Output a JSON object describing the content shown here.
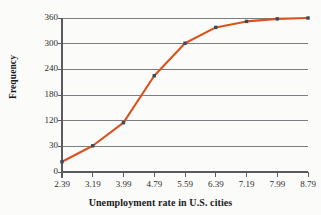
{
  "chart_data": {
    "type": "line",
    "title": "",
    "subtitle": "",
    "xlabel": "Unemployment rate in U.S. cities",
    "ylabel": "Frequency",
    "x": [
      2.39,
      3.19,
      3.99,
      4.79,
      5.59,
      6.39,
      7.19,
      7.99,
      8.79
    ],
    "xtick_labels": [
      "2.39",
      "3.19",
      "3.99",
      "4.79",
      "5.59",
      "6.39",
      "7.19",
      "7.99",
      "8.79"
    ],
    "values": [
      12,
      32,
      113,
      225,
      301,
      338,
      352,
      358,
      361
    ],
    "ytick_labels": [
      "0",
      "30",
      "120",
      "180",
      "240",
      "300",
      "360"
    ],
    "ytick_values": [
      0,
      30,
      120,
      180,
      240,
      300,
      360
    ],
    "ylim": [
      0,
      360
    ],
    "xlim": [
      2.39,
      8.79
    ],
    "grid": "horizontal",
    "legend": "none",
    "series": [
      {
        "name": "Cumulative frequency",
        "values": [
          12,
          32,
          113,
          225,
          301,
          338,
          352,
          358,
          361
        ]
      }
    ],
    "annotations": [],
    "colors": {
      "line": "#d9531e",
      "marker": "#3a4a5a",
      "gridline": "#6e6e73",
      "axis": "#5a5a5f",
      "background": "#fbfbfa",
      "text": "#1a1a1a"
    }
  }
}
